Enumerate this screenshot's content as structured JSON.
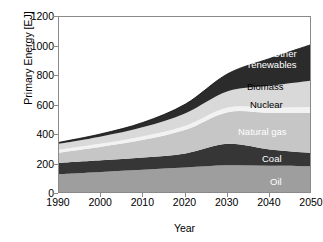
{
  "figure": {
    "background": "#ffffff",
    "frame_color": "#8a8a8a"
  },
  "axes": {
    "ylabel": "Primary Energy [EJ]",
    "xlabel": "Year",
    "yticks": [
      "0",
      "200",
      "400",
      "600",
      "800",
      "1000",
      "1200"
    ],
    "ytick_values": [
      0,
      200,
      400,
      600,
      800,
      1000,
      1200
    ],
    "xticks": [
      "1990",
      "2000",
      "2010",
      "2020",
      "2030",
      "2040",
      "2050"
    ],
    "xtick_values": [
      1990,
      2000,
      2010,
      2020,
      2030,
      2040,
      2050
    ]
  },
  "band_labels": [
    {
      "text": "Other renewables",
      "line1": "Other",
      "line2": "renewables",
      "style": "light",
      "x": 248,
      "y": 49
    },
    {
      "text": "Biomass",
      "style": "dark",
      "x": 247,
      "y": 82
    },
    {
      "text": "Nuclear",
      "style": "dark",
      "x": 250,
      "y": 100
    },
    {
      "text": "Natural gas",
      "style": "light",
      "x": 238,
      "y": 127
    },
    {
      "text": "Coal",
      "style": "light",
      "x": 262,
      "y": 154
    },
    {
      "text": "Oil",
      "style": "light",
      "x": 270,
      "y": 177
    }
  ],
  "chart_data": {
    "type": "area",
    "stacked": true,
    "title": "",
    "xlabel": "Year",
    "ylabel": "Primary Energy [EJ]",
    "xlim": [
      1990,
      2050
    ],
    "ylim": [
      0,
      1200
    ],
    "grid": false,
    "legend": "in-plot band labels",
    "x": [
      1990,
      2000,
      2010,
      2020,
      2030,
      2040,
      2050
    ],
    "series": [
      {
        "name": "Oil",
        "color": "#9e9e9e",
        "label_color": "#ffffff",
        "values": [
          135,
          150,
          165,
          180,
          195,
          192,
          188
        ]
      },
      {
        "name": "Coal",
        "color": "#363636",
        "label_color": "#ffffff",
        "values": [
          75,
          78,
          82,
          95,
          145,
          110,
          90
        ]
      },
      {
        "name": "Natural gas",
        "color": "#c6c6c6",
        "label_color": "#ffffff",
        "values": [
          70,
          92,
          120,
          160,
          215,
          248,
          272
        ]
      },
      {
        "name": "Nuclear",
        "color": "#f2f2f2",
        "label_color": "#000000",
        "values": [
          20,
          22,
          25,
          28,
          32,
          36,
          40
        ]
      },
      {
        "name": "Biomass",
        "color": "#d9d9d9",
        "label_color": "#000000",
        "values": [
          40,
          48,
          62,
          85,
          110,
          148,
          180
        ]
      },
      {
        "name": "Other renewables",
        "color": "#2b2b2b",
        "label_color": "#ffffff",
        "values": [
          10,
          18,
          32,
          62,
          118,
          185,
          245
        ]
      }
    ],
    "cumulative_top": [
      350,
      408,
      486,
      610,
      815,
      919,
      1015
    ],
    "units": "EJ"
  }
}
